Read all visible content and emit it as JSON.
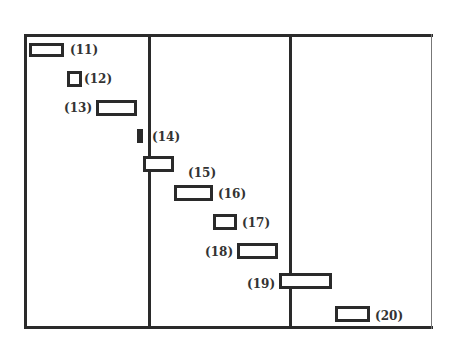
{
  "diagram": {
    "type": "staggered interval / timing diagram",
    "frame_color": "#2a2a2a",
    "dividers": [
      {
        "name": "divider-1",
        "x": 148
      },
      {
        "name": "divider-2",
        "x": 289
      }
    ],
    "items": [
      {
        "label": "(11)",
        "x": 29,
        "y": 43,
        "w": 35,
        "h": 14,
        "label_x": 70,
        "label_y": 43,
        "filled": false
      },
      {
        "label": "(12)",
        "x": 67,
        "y": 71,
        "w": 15,
        "h": 16,
        "label_x": 84,
        "label_y": 72,
        "filled": false
      },
      {
        "label": "(13)",
        "x": 96,
        "y": 100,
        "w": 41,
        "h": 16,
        "label_x": 64,
        "label_y": 101,
        "filled": false
      },
      {
        "label": "(14)",
        "x": 137,
        "y": 129,
        "w": 6,
        "h": 14,
        "label_x": 152,
        "label_y": 130,
        "filled": true
      },
      {
        "label": "(15)",
        "x": 143,
        "y": 156,
        "w": 31,
        "h": 16,
        "label_x": 188,
        "label_y": 166,
        "filled": false
      },
      {
        "label": "(16)",
        "x": 174,
        "y": 185,
        "w": 39,
        "h": 16,
        "label_x": 218,
        "label_y": 187,
        "filled": false
      },
      {
        "label": "(17)",
        "x": 213,
        "y": 214,
        "w": 24,
        "h": 16,
        "label_x": 242,
        "label_y": 216,
        "filled": false
      },
      {
        "label": "(18)",
        "x": 237,
        "y": 243,
        "w": 41,
        "h": 16,
        "label_x": 205,
        "label_y": 245,
        "filled": false
      },
      {
        "label": "(19)",
        "x": 279,
        "y": 273,
        "w": 53,
        "h": 16,
        "label_x": 247,
        "label_y": 277,
        "filled": false
      },
      {
        "label": "(20)",
        "x": 335,
        "y": 306,
        "w": 35,
        "h": 16,
        "label_x": 375,
        "label_y": 309,
        "filled": false
      }
    ]
  }
}
